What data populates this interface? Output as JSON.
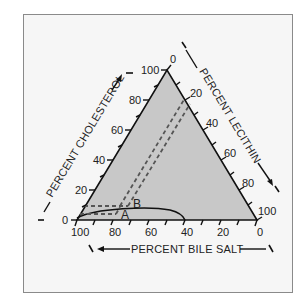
{
  "diagram": {
    "type": "ternary-phase-diagram",
    "axes": {
      "cholesterol": {
        "title": "PERCENT CHOLESTEROL",
        "ticks": [
          "0",
          "20",
          "40",
          "60",
          "80",
          "100"
        ]
      },
      "lecithin": {
        "title": "PERCENT LECITHIN",
        "ticks": [
          "0",
          "20",
          "40",
          "60",
          "80",
          "100"
        ]
      },
      "bile_salt": {
        "title": "PERCENT BILE SALT",
        "ticks": [
          "100",
          "80",
          "60",
          "40",
          "20",
          "0"
        ]
      }
    },
    "points": {
      "a": "A",
      "b": "B"
    },
    "colors": {
      "triangle_fill": "#c8c8c8",
      "frame_bg": "#f6f6f6",
      "line": "#111111",
      "dashed": "#555555"
    }
  }
}
